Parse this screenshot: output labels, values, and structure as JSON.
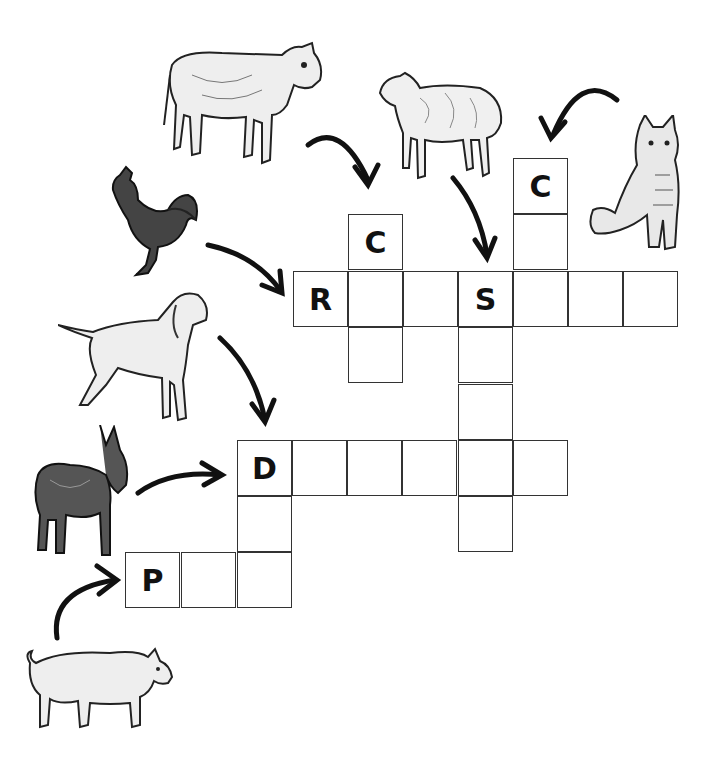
{
  "puzzle": {
    "type": "crossword",
    "theme": "farm animals",
    "cell_size": 55,
    "cells": [
      {
        "x": 513,
        "y": 158,
        "letter": "C",
        "word": "cat"
      },
      {
        "x": 513,
        "y": 214,
        "letter": ""
      },
      {
        "x": 348,
        "y": 214,
        "letter": "C",
        "word": "cow"
      },
      {
        "x": 293,
        "y": 271,
        "letter": "R",
        "word": "rooster"
      },
      {
        "x": 348,
        "y": 271,
        "letter": ""
      },
      {
        "x": 403,
        "y": 271,
        "letter": ""
      },
      {
        "x": 458,
        "y": 271,
        "letter": "S",
        "word": "sheep"
      },
      {
        "x": 513,
        "y": 271,
        "letter": ""
      },
      {
        "x": 568,
        "y": 271,
        "letter": ""
      },
      {
        "x": 623,
        "y": 271,
        "letter": ""
      },
      {
        "x": 348,
        "y": 327,
        "letter": ""
      },
      {
        "x": 458,
        "y": 327,
        "letter": ""
      },
      {
        "x": 458,
        "y": 384,
        "letter": ""
      },
      {
        "x": 237,
        "y": 440,
        "letter": "D",
        "word": "dog / donkey"
      },
      {
        "x": 292,
        "y": 440,
        "letter": ""
      },
      {
        "x": 347,
        "y": 440,
        "letter": ""
      },
      {
        "x": 402,
        "y": 440,
        "letter": ""
      },
      {
        "x": 458,
        "y": 440,
        "letter": ""
      },
      {
        "x": 513,
        "y": 440,
        "letter": ""
      },
      {
        "x": 458,
        "y": 496,
        "letter": ""
      },
      {
        "x": 237,
        "y": 496,
        "letter": ""
      },
      {
        "x": 125,
        "y": 552,
        "letter": "P",
        "word": "pig"
      },
      {
        "x": 181,
        "y": 552,
        "letter": ""
      },
      {
        "x": 237,
        "y": 552,
        "letter": ""
      }
    ],
    "animals": [
      "cow",
      "sheep",
      "cat",
      "rooster",
      "dog",
      "donkey",
      "pig"
    ]
  }
}
